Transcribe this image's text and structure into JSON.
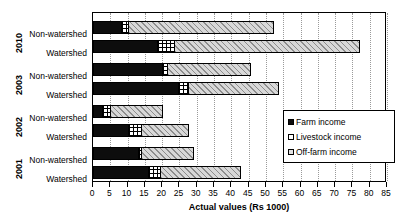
{
  "chart_data": {
    "type": "bar",
    "orientation": "horizontal",
    "stacked": true,
    "title": "",
    "xlabel": "Actual values (Rs 1000)",
    "ylabel": "",
    "xlim": [
      0,
      85
    ],
    "xticks": [
      0,
      5,
      10,
      15,
      20,
      25,
      30,
      35,
      40,
      45,
      50,
      55,
      60,
      65,
      70,
      75,
      80,
      85
    ],
    "grid": "vertical-dotted",
    "legend_position": "right-middle",
    "legend": [
      "Farm income",
      "Livestock income",
      "Off-farm income"
    ],
    "series": [
      {
        "name": "Farm income",
        "values": [
          8.0,
          18.5,
          20.0,
          24.5,
          2.5,
          10.0,
          13.0,
          16.0
        ]
      },
      {
        "name": "Livestock income",
        "values": [
          2.0,
          5.0,
          1.5,
          3.0,
          2.5,
          4.0,
          1.0,
          3.5
        ]
      },
      {
        "name": "Off-farm income",
        "values": [
          42.0,
          53.5,
          24.0,
          26.0,
          15.0,
          13.5,
          15.0,
          23.0
        ]
      }
    ],
    "groups": [
      {
        "year": "2010",
        "rows": [
          {
            "category": "Non-watershed",
            "farm": 8.0,
            "livestock": 2.0,
            "offfarm": 42.0,
            "total": 52.0
          },
          {
            "category": "Watershed",
            "farm": 18.5,
            "livestock": 5.0,
            "offfarm": 53.5,
            "total": 77.0
          }
        ]
      },
      {
        "year": "2003",
        "rows": [
          {
            "category": "Non-watershed",
            "farm": 20.0,
            "livestock": 1.5,
            "offfarm": 24.0,
            "total": 45.5
          },
          {
            "category": "Watershed",
            "farm": 24.5,
            "livestock": 3.0,
            "offfarm": 26.0,
            "total": 53.5
          }
        ]
      },
      {
        "year": "2002",
        "rows": [
          {
            "category": "Non-watershed",
            "farm": 2.5,
            "livestock": 2.5,
            "offfarm": 15.0,
            "total": 20.0
          },
          {
            "category": "Watershed",
            "farm": 10.0,
            "livestock": 4.0,
            "offfarm": 13.5,
            "total": 27.5
          }
        ]
      },
      {
        "year": "2001",
        "rows": [
          {
            "category": "Non-watershed",
            "farm": 13.0,
            "livestock": 1.0,
            "offfarm": 15.0,
            "total": 29.0
          },
          {
            "category": "Watershed",
            "farm": 16.0,
            "livestock": 3.5,
            "offfarm": 23.0,
            "total": 42.5
          }
        ]
      }
    ],
    "colors": {
      "farm": "#0d0d0d",
      "livestock": "#ffffff",
      "offfarm": "#d8d8d8",
      "axis": "#000000",
      "grid": "#9a9a9a"
    }
  }
}
